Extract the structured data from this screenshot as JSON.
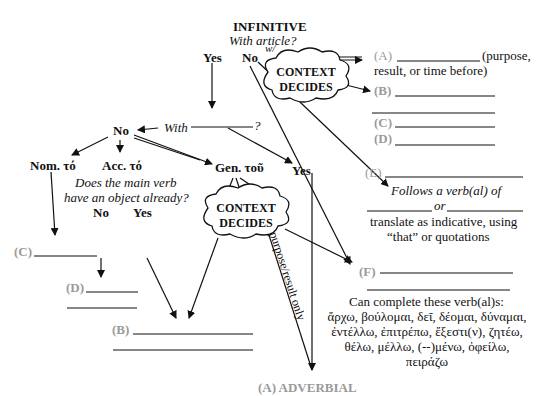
{
  "title": "INFINITIVE",
  "question_article": "With article?",
  "top": {
    "yes": "Yes",
    "no": "No",
    "w_label": "w/"
  },
  "cloud1": {
    "line1": "CONTEXT",
    "line2": "DECIDES"
  },
  "cloud2": {
    "line1": "CONTEXT",
    "line2": "DECIDES"
  },
  "with_q": {
    "prefix": "With",
    "suffix": "?"
  },
  "mid": {
    "no": "No",
    "yes": "Yes"
  },
  "cases": {
    "nom": "Nom. τό",
    "acc": "Acc. τό",
    "gen": "Gen. τοῦ"
  },
  "object_q": {
    "line1": "Does the main verb",
    "line2": "have an object already?",
    "no": "No",
    "yes": "Yes"
  },
  "right": {
    "a_label": "(A)",
    "a_text1": "(purpose,",
    "a_text2": "result, or time before)",
    "b_label": "(B)",
    "c_label": "(C)",
    "d_label": "(D)",
    "e_label": "(E)",
    "e_follows": "Follows a verb(al) of",
    "e_or": "or",
    "e_translate1": "translate as indicative, using",
    "e_translate2": "“that” or quotations",
    "f_label": "(F)",
    "complete_title": "Can complete these verb(al)s:",
    "verbs": [
      "ἄρχω, βούλομαι, δεῖ, δέομαι, δύναμαι,",
      "ἐντέλλω, ἐπιτρέπω, ἔξεστι(ν), ζητέω,",
      "θέλω, μέλλω, (--)μένω, ὀφείλω,",
      "πειράζω"
    ]
  },
  "left": {
    "c_label": "(C)",
    "d_label": "(D)",
    "b_label": "(B)"
  },
  "purpose_only": "purpose/result only",
  "adverbial": "(A) ADVERBIAL",
  "colors": {
    "ink": "#111111",
    "gray_label": "#9a9a9a"
  }
}
